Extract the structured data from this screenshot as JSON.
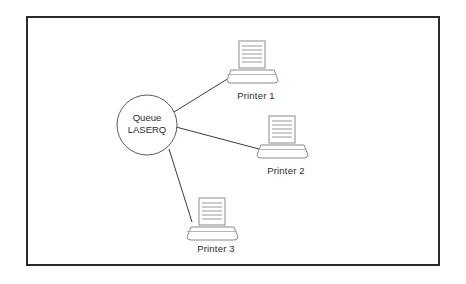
{
  "diagram": {
    "type": "network-topology",
    "title": "",
    "background_color": "#ffffff",
    "frame": {
      "border_color": "#2a2a2a",
      "fill_color": "#ffffff"
    },
    "line_color": "#3a3a3a",
    "shape_stroke_color": "#808080",
    "text_color": "#2b2b2b",
    "queue_node": {
      "id": "queue-laserq",
      "shape": "circle",
      "label_line_1": "Queue",
      "label_line_2": "LASERQ",
      "cx": 147,
      "cy": 125,
      "r": 30
    },
    "printer_nodes": [
      {
        "id": "printer-1",
        "label": "Printer 1",
        "icon": "printer-icon",
        "x": 226,
        "y": 40,
        "caption_x": 228,
        "caption_y": 90
      },
      {
        "id": "printer-2",
        "label": "Printer 2",
        "icon": "printer-icon",
        "x": 256,
        "y": 114,
        "caption_x": 256,
        "caption_y": 165
      },
      {
        "id": "printer-3",
        "label": "Printer 3",
        "icon": "printer-icon",
        "x": 186,
        "y": 196,
        "caption_x": 190,
        "caption_y": 243
      }
    ],
    "connections": [
      {
        "id": "link-queue-printer-1",
        "from": "queue-laserq",
        "to": "printer-1"
      },
      {
        "id": "link-queue-printer-2",
        "from": "queue-laserq",
        "to": "printer-2"
      },
      {
        "id": "link-queue-printer-3",
        "from": "queue-laserq",
        "to": "printer-3"
      }
    ]
  }
}
